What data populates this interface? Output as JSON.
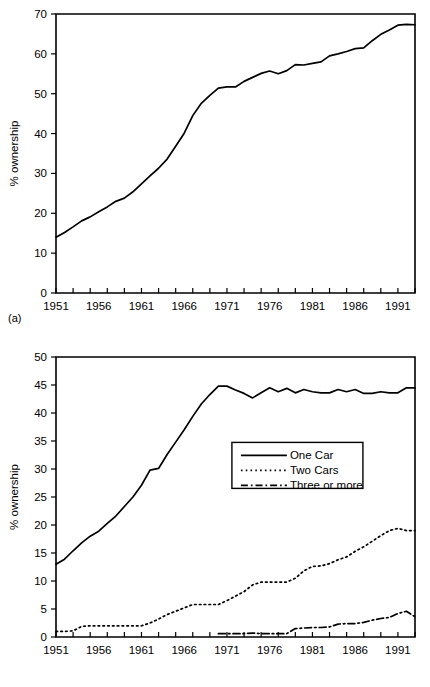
{
  "figure": {
    "panel_a_tag": "(a)",
    "panel_b_tag": "(b)"
  },
  "chart_data": [
    {
      "id": "panel-a",
      "type": "line",
      "title": "",
      "subtitle": "",
      "xlabel": "",
      "ylabel": "% ownership",
      "xlim": [
        1951,
        1993
      ],
      "ylim": [
        0,
        70
      ],
      "ytick_step": 10,
      "yticks": [
        0,
        10,
        20,
        30,
        40,
        50,
        60,
        70
      ],
      "ytick_labels": [
        "0",
        "10",
        "20",
        "30",
        "40",
        "50",
        "60",
        "70"
      ],
      "xtick_labels": [
        "1951",
        "1956",
        "1961",
        "1966",
        "1971",
        "1976",
        "1981",
        "1986",
        "1991"
      ],
      "xtick_label_values": [
        1951,
        1956,
        1961,
        1966,
        1971,
        1976,
        1981,
        1986,
        1991
      ],
      "xtick_minor_step": 2,
      "grid": false,
      "legend": null,
      "x": [
        1951,
        1952,
        1953,
        1954,
        1955,
        1956,
        1957,
        1958,
        1959,
        1960,
        1961,
        1962,
        1963,
        1964,
        1965,
        1966,
        1967,
        1968,
        1969,
        1970,
        1971,
        1972,
        1973,
        1974,
        1975,
        1976,
        1977,
        1978,
        1979,
        1980,
        1981,
        1982,
        1983,
        1984,
        1985,
        1986,
        1987,
        1988,
        1989,
        1990,
        1991,
        1992,
        1993
      ],
      "series": [
        {
          "name": "Household car ownership",
          "values": [
            14.0,
            15.2,
            16.6,
            18.1,
            19.1,
            20.4,
            21.6,
            23.0,
            23.8,
            25.4,
            27.4,
            29.4,
            31.3,
            33.6,
            36.8,
            40.1,
            44.5,
            47.6,
            49.6,
            51.4,
            51.7,
            51.7,
            53.1,
            54.1,
            55.1,
            55.7,
            55.0,
            55.8,
            57.3,
            57.2,
            57.6,
            58.0,
            59.5,
            60.0,
            60.6,
            61.3,
            61.5,
            63.3,
            64.9,
            66.0,
            67.2,
            67.4,
            67.3
          ]
        }
      ]
    },
    {
      "id": "panel-b",
      "type": "line",
      "title": "",
      "subtitle": "",
      "xlabel": "",
      "ylabel": "% ownership",
      "xlim": [
        1951,
        1993
      ],
      "ylim": [
        0,
        50
      ],
      "ytick_step": 5,
      "yticks": [
        0,
        5,
        10,
        15,
        20,
        25,
        30,
        35,
        40,
        45,
        50
      ],
      "ytick_labels": [
        "0",
        "5",
        "10",
        "15",
        "20",
        "25",
        "30",
        "35",
        "40",
        "45",
        "50"
      ],
      "xtick_labels": [
        "1951",
        "1956",
        "1961",
        "1966",
        "1971",
        "1976",
        "1981",
        "1986",
        "1991"
      ],
      "xtick_label_values": [
        1951,
        1956,
        1961,
        1966,
        1971,
        1976,
        1981,
        1986,
        1991
      ],
      "xtick_minor_step": 2,
      "grid": false,
      "legend": {
        "position": "center",
        "entries": [
          {
            "label": "One Car",
            "style": "solid"
          },
          {
            "label": "Two Cars",
            "style": "dotted"
          },
          {
            "label": "Three or more",
            "style": "dashdot"
          }
        ]
      },
      "x": [
        1951,
        1952,
        1953,
        1954,
        1955,
        1956,
        1957,
        1958,
        1959,
        1960,
        1961,
        1962,
        1963,
        1964,
        1965,
        1966,
        1967,
        1968,
        1969,
        1970,
        1971,
        1972,
        1973,
        1974,
        1975,
        1976,
        1977,
        1978,
        1979,
        1980,
        1981,
        1982,
        1983,
        1984,
        1985,
        1986,
        1987,
        1988,
        1989,
        1990,
        1991,
        1992,
        1993
      ],
      "series": [
        {
          "name": "One Car",
          "style": "solid",
          "values": [
            13.0,
            13.9,
            15.4,
            16.8,
            18.0,
            18.9,
            20.3,
            21.6,
            23.3,
            25.0,
            27.1,
            29.8,
            30.1,
            32.6,
            34.8,
            37.0,
            39.4,
            41.6,
            43.3,
            44.8,
            44.8,
            44.1,
            43.5,
            42.7,
            43.6,
            44.5,
            43.8,
            44.4,
            43.6,
            44.2,
            43.8,
            43.6,
            43.6,
            44.2,
            43.8,
            44.2,
            43.5,
            43.5,
            43.8,
            43.6,
            43.6,
            44.5,
            44.5
          ]
        },
        {
          "name": "Two Cars",
          "style": "dotted",
          "values": [
            1.0,
            1.0,
            1.1,
            1.9,
            2.0,
            2.0,
            2.0,
            2.0,
            2.0,
            2.0,
            2.0,
            2.5,
            3.2,
            4.0,
            4.6,
            5.2,
            5.8,
            5.8,
            5.8,
            5.8,
            6.5,
            7.3,
            8.1,
            9.3,
            9.8,
            9.8,
            9.8,
            9.8,
            10.5,
            11.8,
            12.6,
            12.7,
            13.1,
            13.8,
            14.3,
            15.3,
            16.1,
            17.1,
            18.1,
            19.0,
            19.4,
            19.0,
            19.0
          ]
        },
        {
          "name": "Three or more",
          "style": "dashdot",
          "values": [
            null,
            null,
            null,
            null,
            null,
            null,
            null,
            null,
            null,
            null,
            null,
            null,
            null,
            null,
            null,
            null,
            null,
            null,
            null,
            0.6,
            0.6,
            0.6,
            0.6,
            0.7,
            0.6,
            0.6,
            0.6,
            0.6,
            1.5,
            1.6,
            1.7,
            1.7,
            1.8,
            2.3,
            2.4,
            2.4,
            2.6,
            3.0,
            3.3,
            3.5,
            4.2,
            4.6,
            3.6
          ]
        }
      ]
    }
  ]
}
